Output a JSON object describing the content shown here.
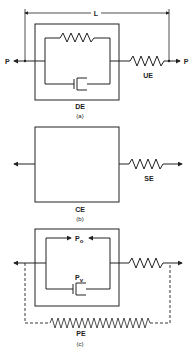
{
  "figure": {
    "panel_a": {
      "dimension_label": "L",
      "left_force_label": "P",
      "right_force_label": "P",
      "box_label": "DE",
      "series_element_label": "UE",
      "caption": "(a)"
    },
    "panel_b": {
      "box_label": "CE",
      "series_element_label": "SE",
      "caption": "(b)"
    },
    "panel_c": {
      "top_branch_label": "P",
      "top_branch_subscript": "o",
      "bottom_branch_label": "P",
      "bottom_branch_subscript": "v",
      "parallel_element_label": "PE",
      "caption": "(c)"
    }
  },
  "colors": {
    "line": "#222222",
    "background": "#ffffff"
  }
}
